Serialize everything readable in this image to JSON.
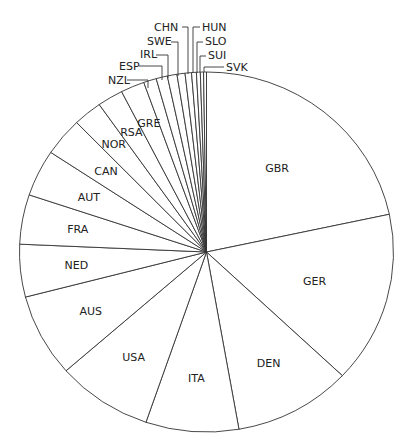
{
  "chart_data": {
    "type": "pie",
    "title": "",
    "start_angle_deg": 0,
    "direction": "clockwise",
    "categories": [
      "GBR",
      "GER",
      "DEN",
      "ITA",
      "USA",
      "AUS",
      "NED",
      "FRA",
      "AUT",
      "CAN",
      "NOR",
      "RSA",
      "GRE",
      "NZL",
      "ESP",
      "IRL",
      "SWE",
      "CHN",
      "HUN",
      "SLO",
      "SUI",
      "SVK"
    ],
    "values_deg": [
      77.9,
      55.5,
      36.6,
      28.9,
      29.8,
      26.8,
      17.0,
      16.0,
      15.1,
      12.4,
      9.0,
      8.0,
      7.4,
      4.0,
      3.5,
      3.0,
      2.5,
      2.0,
      1.5,
      1.2,
      1.0,
      0.9
    ],
    "values_pct": [
      21.6,
      15.4,
      10.2,
      8.0,
      8.3,
      7.4,
      4.7,
      4.4,
      4.2,
      3.4,
      2.5,
      2.2,
      2.1,
      1.1,
      1.0,
      0.8,
      0.7,
      0.6,
      0.4,
      0.3,
      0.3,
      0.3
    ],
    "legend": "none (labels on slices / leader lines)",
    "colors": {
      "fill": "#ffffff",
      "stroke": "#333333",
      "text": "#222222"
    }
  },
  "outside_labels": [
    {
      "name": "NZL",
      "x": 108,
      "y": 84,
      "lx": [
        127,
        148
      ],
      "ly": [
        80,
        88
      ]
    },
    {
      "name": "ESP",
      "x": 119,
      "y": 70,
      "lx": [
        139,
        162
      ],
      "ly": [
        66,
        80
      ]
    },
    {
      "name": "IRL",
      "x": 140,
      "y": 58,
      "lx": [
        156,
        168
      ],
      "ly": [
        55,
        78
      ]
    },
    {
      "name": "SWE",
      "x": 147,
      "y": 45,
      "lx": [
        171,
        178
      ],
      "ly": [
        42,
        76
      ]
    },
    {
      "name": "CHN",
      "x": 154,
      "y": 31,
      "lx": [
        182,
        188
      ],
      "ly": [
        27,
        74
      ]
    },
    {
      "name": "HUN",
      "x": 202,
      "y": 31,
      "lx": [
        200,
        193
      ],
      "ly": [
        27,
        73
      ]
    },
    {
      "name": "SLO",
      "x": 205,
      "y": 45,
      "lx": [
        203,
        197
      ],
      "ly": [
        42,
        73
      ]
    },
    {
      "name": "SUI",
      "x": 208,
      "y": 59,
      "lx": [
        206,
        200
      ],
      "ly": [
        56,
        72
      ]
    },
    {
      "name": "SVK",
      "x": 226,
      "y": 71,
      "lx": [
        224,
        204
      ],
      "ly": [
        67,
        72
      ]
    }
  ]
}
